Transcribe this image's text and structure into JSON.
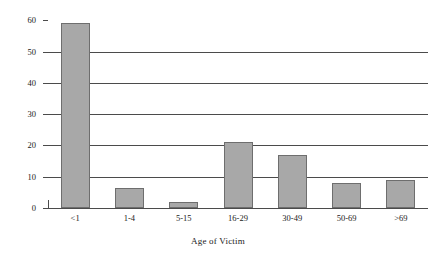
{
  "chart_data": {
    "type": "bar",
    "title": "",
    "xlabel": "Age of Victim",
    "ylabel": "Homicides per Million",
    "categories": [
      "<1",
      "1-4",
      "5-15",
      "16-29",
      "30-49",
      "50-69",
      ">69"
    ],
    "values": [
      59,
      6.5,
      2,
      21,
      17,
      8,
      9
    ],
    "ylim": [
      0,
      62
    ],
    "yticks": [
      0,
      10,
      20,
      30,
      40,
      50,
      60
    ],
    "ytick_labels": [
      "0",
      "10",
      "20",
      "30",
      "40",
      "50",
      "60"
    ],
    "gridlines_at": [
      10,
      20,
      30,
      40,
      50
    ],
    "grid": true,
    "legend": "none",
    "bar_color": "#a8a8a8",
    "bar_border_color": "#6e6e6e",
    "axis_color": "#4b4b4b",
    "background": "#ffffff"
  },
  "axes": {
    "y_title": "Homicides per Million",
    "x_title": "Age of Victim"
  },
  "footer": {
    "clipped_caption": ""
  }
}
